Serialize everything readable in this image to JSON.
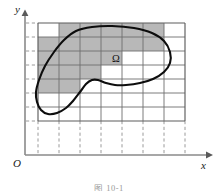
{
  "figure": {
    "caption": "图 10-1",
    "region_label": "Ω",
    "axis_x_label": "x",
    "axis_y_label": "y",
    "origin_label": "O",
    "colors": {
      "shaded_cell": "#b8b8b8",
      "curve": "#0d0d0d",
      "grid": "#6e6e6e",
      "axis": "#8a8a8a",
      "background": "#ffffff"
    }
  },
  "chart_data": {
    "type": "area",
    "title": "",
    "subtitle": "",
    "xlabel": "x",
    "ylabel": "y",
    "legend": [],
    "grid": true,
    "grid_spec": {
      "x_lines_px": [
        38,
        59,
        80,
        101,
        122,
        143,
        164,
        185
      ],
      "y_lines_px": [
        23,
        37,
        51,
        65,
        79,
        93,
        107,
        121
      ],
      "cell_width_px": 21,
      "cell_height_px": 14,
      "columns": 7,
      "rows": 7
    },
    "shaded_cells": [
      {
        "col": 2,
        "row": 1
      },
      {
        "col": 3,
        "row": 1
      },
      {
        "col": 4,
        "row": 1
      },
      {
        "col": 5,
        "row": 1
      },
      {
        "col": 6,
        "row": 1
      },
      {
        "col": 1,
        "row": 2
      },
      {
        "col": 2,
        "row": 2
      },
      {
        "col": 3,
        "row": 2
      },
      {
        "col": 4,
        "row": 2
      },
      {
        "col": 5,
        "row": 2
      },
      {
        "col": 6,
        "row": 2
      },
      {
        "col": 1,
        "row": 3
      },
      {
        "col": 2,
        "row": 3
      },
      {
        "col": 3,
        "row": 3
      },
      {
        "col": 4,
        "row": 3
      },
      {
        "col": 1,
        "row": 4
      },
      {
        "col": 2,
        "row": 4
      },
      {
        "col": 3,
        "row": 4
      },
      {
        "col": 1,
        "row": 5
      },
      {
        "col": 2,
        "row": 5
      }
    ],
    "shaded_cell_count": 20,
    "region_outline_px": [
      [
        92,
        27
      ],
      [
        112,
        26
      ],
      [
        134,
        28
      ],
      [
        152,
        33
      ],
      [
        164,
        41
      ],
      [
        170,
        52
      ],
      [
        170,
        63
      ],
      [
        164,
        72
      ],
      [
        153,
        79
      ],
      [
        140,
        83
      ],
      [
        126,
        85
      ],
      [
        115,
        85
      ],
      [
        106,
        83
      ],
      [
        98,
        80
      ],
      [
        92,
        80
      ],
      [
        86,
        84
      ],
      [
        80,
        92
      ],
      [
        73,
        101
      ],
      [
        66,
        108
      ],
      [
        57,
        113
      ],
      [
        48,
        114
      ],
      [
        41,
        110
      ],
      [
        37,
        102
      ],
      [
        36,
        92
      ],
      [
        39,
        80
      ],
      [
        45,
        66
      ],
      [
        54,
        52
      ],
      [
        64,
        40
      ],
      [
        76,
        31
      ],
      [
        92,
        27
      ]
    ],
    "axis_origin_px": [
      25,
      155
    ],
    "axis_x_extent_px": [
      14,
      212
    ],
    "axis_y_extent_px": [
      10,
      160
    ]
  }
}
